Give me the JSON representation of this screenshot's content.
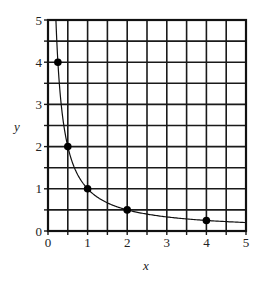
{
  "chart_data": {
    "type": "line",
    "title": "",
    "xlabel": "x",
    "ylabel": "y",
    "xlim": [
      0,
      5
    ],
    "ylim": [
      0,
      5
    ],
    "grid": true,
    "grid_step": 0.5,
    "x_ticks": [
      "0",
      "1",
      "2",
      "3",
      "4",
      "5"
    ],
    "y_ticks": [
      "0",
      "1",
      "2",
      "3",
      "4",
      "5"
    ],
    "curve": {
      "name": "y = 1/x",
      "function": "1/x",
      "x_range": [
        0.2,
        5
      ]
    },
    "points": [
      {
        "x": 0.25,
        "y": 4
      },
      {
        "x": 0.5,
        "y": 2
      },
      {
        "x": 1,
        "y": 1
      },
      {
        "x": 2,
        "y": 0.5
      },
      {
        "x": 4,
        "y": 0.25
      }
    ],
    "colors": {
      "line": "#111111",
      "grid": "#1a1a1a",
      "point": "#000000"
    }
  }
}
